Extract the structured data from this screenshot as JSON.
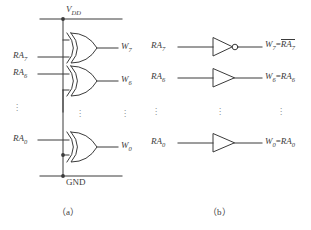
{
  "figure": {
    "panel_a": {
      "caption": "（a）",
      "rails": {
        "vdd_label": "V",
        "vdd_sub": "DD",
        "gnd_label": "GND"
      },
      "rows": [
        {
          "input": "RA",
          "input_sub": "7",
          "output": "W",
          "output_sub": "7",
          "gate": "xor-gate"
        },
        {
          "input": "RA",
          "input_sub": "6",
          "output": "W",
          "output_sub": "6",
          "gate": "xor-gate"
        },
        {
          "input": "RA",
          "input_sub": "0",
          "output": "W",
          "output_sub": "0",
          "gate": "xor-gate"
        }
      ],
      "ellipsis": "⋮"
    },
    "panel_b": {
      "caption": "（b）",
      "rows": [
        {
          "input": "RA",
          "input_sub": "7",
          "gate": "inverter-gate",
          "out_name": "W",
          "out_sub": "7",
          "eq": "=",
          "expr": "RA",
          "expr_sub": "7",
          "overline": true
        },
        {
          "input": "RA",
          "input_sub": "6",
          "gate": "buffer-gate",
          "out_name": "W",
          "out_sub": "6",
          "eq": "=",
          "expr": "RA",
          "expr_sub": "6",
          "overline": false
        },
        {
          "input": "RA",
          "input_sub": "0",
          "gate": "buffer-gate",
          "out_name": "W",
          "out_sub": "0",
          "eq": "=",
          "expr": "RA",
          "expr_sub": "0",
          "overline": false
        }
      ],
      "ellipsis": "⋮"
    },
    "colors": {
      "line": "#3b3b3b",
      "text": "#3b3b3b",
      "background": "#ffffff"
    }
  }
}
